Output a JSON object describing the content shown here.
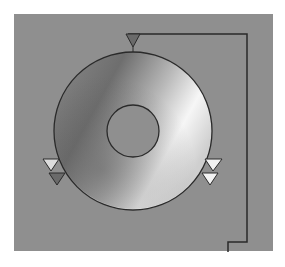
{
  "diagram": {
    "type": "disc-drive-schematic",
    "colors": {
      "background": "#8f8f8f",
      "outline": "#2a2a2a",
      "disc_dark": "#707070",
      "disc_light": "#f4f4f4",
      "marker_dark": "#6a6a6a",
      "marker_light": "#e8e8e8"
    },
    "markers": [
      {
        "name": "top-marker",
        "count": 1,
        "style": "dark"
      },
      {
        "name": "left-marker-pair",
        "count": 2,
        "style": "light-over-dark"
      },
      {
        "name": "right-marker-pair",
        "count": 2,
        "style": "light-over-light"
      }
    ]
  }
}
